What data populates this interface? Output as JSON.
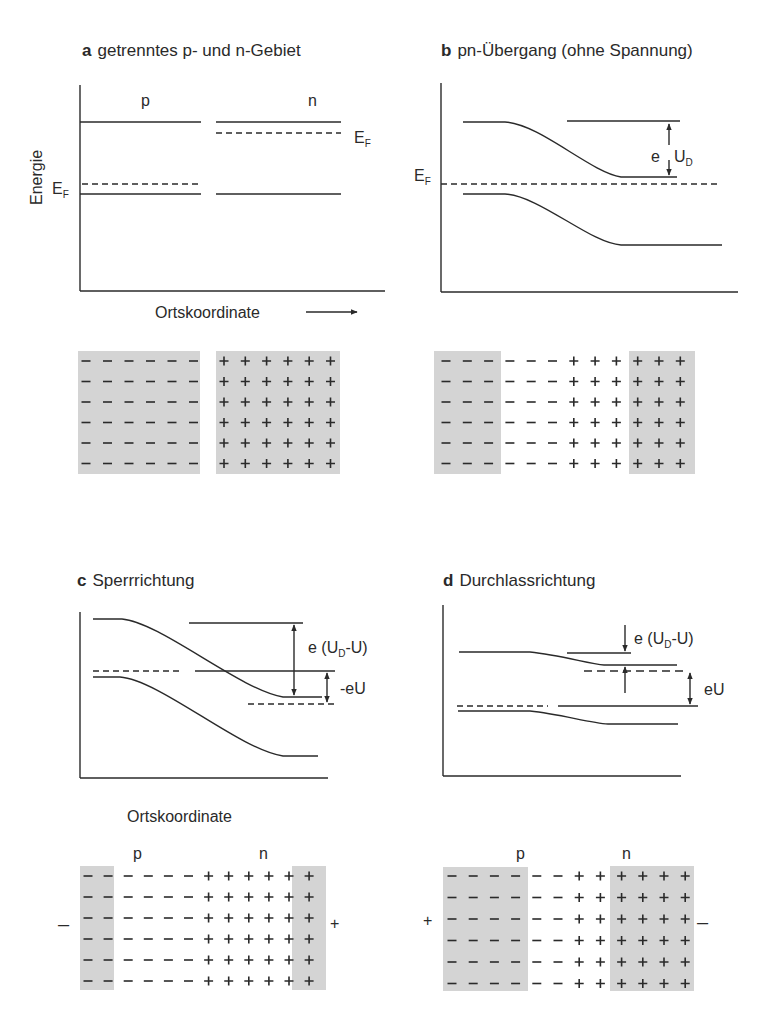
{
  "panels": {
    "a": {
      "letter": "a",
      "title": "getrenntes p- und n-Gebiet",
      "label_p": "p",
      "label_n": "n",
      "ylabel": "Energie",
      "ef": "E",
      "ef_sub": "F",
      "xlabel": "Ortskoordinate"
    },
    "b": {
      "letter": "b",
      "title": "pn-Übergang (ohne Spannung)",
      "ef": "E",
      "ef_sub": "F",
      "gap_e": "e",
      "gap_u": "U",
      "gap_sub": "D"
    },
    "c": {
      "letter": "c",
      "title": "Sperrrichtung",
      "gap1_pre": "e (U",
      "gap1_sub": "D",
      "gap1_post": "-U)",
      "gap2": "-eU",
      "xlabel": "Ortskoordinate",
      "label_p": "p",
      "label_n": "n",
      "left_terminal": "–",
      "right_terminal": "+"
    },
    "d": {
      "letter": "d",
      "title": "Durchlassrichtung",
      "gap1_pre": "e (U",
      "gap1_sub": "D",
      "gap1_post": "-U)",
      "gap2": "eU",
      "label_p": "p",
      "label_n": "n",
      "left_terminal": "+",
      "right_terminal": "–"
    }
  },
  "charge_grids": {
    "a": {
      "p_cols": 6,
      "n_cols": 6,
      "rows": 6
    },
    "b": {
      "shaded_neg_cols": 3,
      "depleted_neg_cols": 3,
      "depleted_pos_cols": 3,
      "shaded_pos_cols": 3,
      "rows": 6
    },
    "c": {
      "shaded_neg_cols": 2,
      "depleted_neg_cols": 4,
      "depleted_pos_cols": 4,
      "shaded_pos_cols": 2,
      "rows": 6
    },
    "d": {
      "shaded_neg_cols": 4,
      "depleted_neg_cols": 2,
      "depleted_pos_cols": 2,
      "shaded_pos_cols": 4,
      "rows": 6
    }
  },
  "colors": {
    "line": "#2a2a2a",
    "shade": "#d4d4d4"
  }
}
